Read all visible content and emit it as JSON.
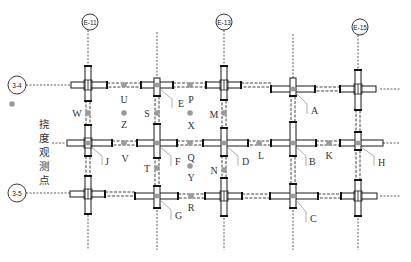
{
  "figure": {
    "type": "structural-plan",
    "column_axes": [
      {
        "label": "E-11",
        "x": 88,
        "circle_x": 90,
        "circle_y": 22
      },
      {
        "label": "E-13",
        "x": 224,
        "circle_x": 224,
        "circle_y": 22
      },
      {
        "label": "E-15",
        "x": 358,
        "circle_x": 360,
        "circle_y": 27
      }
    ],
    "row_axes": [
      {
        "label": "3-4",
        "y": 85,
        "circle_x": 16,
        "circle_y": 85
      },
      {
        "label": "3-5",
        "y": 196,
        "circle_x": 16,
        "circle_y": 193
      }
    ],
    "legend": {
      "marker_color": "#9a9a9a",
      "text": "挠度观测点",
      "chars": [
        "挠",
        "度",
        "观",
        "测",
        "点"
      ]
    },
    "joint_labels": [
      {
        "label": "E",
        "x": 178,
        "y": 107
      },
      {
        "label": "A",
        "x": 295,
        "y": 114
      },
      {
        "label": "J",
        "x": 107,
        "y": 163
      },
      {
        "label": "F",
        "x": 176,
        "y": 164
      },
      {
        "label": "D",
        "x": 245,
        "y": 164
      },
      {
        "label": "B",
        "x": 312,
        "y": 166
      },
      {
        "label": "H",
        "x": 384,
        "y": 166
      },
      {
        "label": "G",
        "x": 176,
        "y": 217
      },
      {
        "label": "C",
        "x": 311,
        "y": 221
      }
    ],
    "observation_points": [
      {
        "label": "U",
        "dot_x": 124,
        "dot_y": 85,
        "lx": 124,
        "ly": 102
      },
      {
        "label": "P",
        "dot_x": 190,
        "dot_y": 85,
        "lx": 191,
        "ly": 102
      },
      {
        "label": "W",
        "dot_x": 88,
        "dot_y": 113,
        "lx": 77,
        "ly": 116
      },
      {
        "label": "Z",
        "dot_x": 124,
        "dot_y": 113,
        "lx": 124,
        "ly": 127
      },
      {
        "label": "S",
        "dot_x": 157,
        "dot_y": 113,
        "lx": 147,
        "ly": 117
      },
      {
        "label": "X",
        "dot_x": 190,
        "dot_y": 113,
        "lx": 191,
        "ly": 128
      },
      {
        "label": "M",
        "dot_x": 224,
        "dot_y": 113,
        "lx": 215,
        "ly": 117
      },
      {
        "label": "V",
        "dot_x": 124,
        "dot_y": 143,
        "lx": 125,
        "ly": 161
      },
      {
        "label": "Q",
        "dot_x": 190,
        "dot_y": 143,
        "lx": 191,
        "ly": 160
      },
      {
        "label": "L",
        "dot_x": 259,
        "dot_y": 143,
        "lx": 261,
        "ly": 158
      },
      {
        "label": "K",
        "dot_x": 329,
        "dot_y": 143,
        "lx": 329,
        "ly": 158
      },
      {
        "label": "T",
        "dot_x": 157,
        "dot_y": 168,
        "lx": 147,
        "ly": 172
      },
      {
        "label": "Y",
        "dot_x": 190,
        "dot_y": 166,
        "lx": 191,
        "ly": 180
      },
      {
        "label": "N",
        "dot_x": 224,
        "dot_y": 170,
        "lx": 215,
        "ly": 174
      },
      {
        "label": "R",
        "dot_x": 191,
        "dot_y": 196,
        "lx": 191,
        "ly": 210
      }
    ],
    "colors": {
      "line": "#1a1a1a",
      "point": "#9a9a9a",
      "leader": "#8a8a8a"
    }
  }
}
